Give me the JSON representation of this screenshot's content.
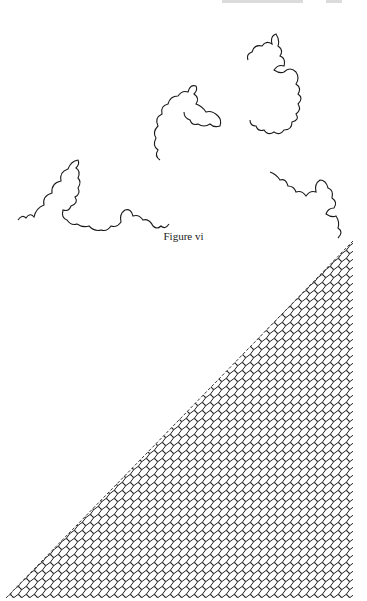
{
  "page": {
    "running_head": "",
    "figure_caption": "Figure vi"
  },
  "figures": [
    {
      "id": "fractal-curve",
      "description": "Dragon-curve-like fractal boundary drawn as a continuous wiggly line forming three lobes"
    },
    {
      "id": "space-filling-triangle",
      "description": "Right triangle densely filled by a space-filling wiggly curve; hypotenuse runs from lower-left to upper-right"
    }
  ],
  "colors": {
    "ink": "#1a1a1a",
    "paper": "#ffffff"
  }
}
